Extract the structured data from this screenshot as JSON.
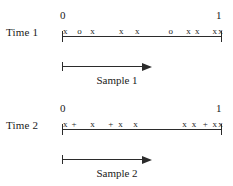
{
  "figure": {
    "description": "Two number lines from 0 to 1 showing sampled observations at two times",
    "ink_color": "#2b2b2b",
    "background_color": "#ffffff"
  },
  "rows": [
    {
      "id": "time1",
      "label": "Time 1",
      "axis": {
        "start_label": "0",
        "end_label": "1",
        "min": 0,
        "max": 1
      },
      "marks": [
        {
          "symbol": "x",
          "position": 0.02
        },
        {
          "symbol": "o",
          "position": 0.11
        },
        {
          "symbol": "x",
          "position": 0.19
        },
        {
          "symbol": "x",
          "position": 0.37
        },
        {
          "symbol": "x",
          "position": 0.47
        },
        {
          "symbol": "o",
          "position": 0.68
        },
        {
          "symbol": "x",
          "position": 0.79
        },
        {
          "symbol": "x",
          "position": 0.845
        },
        {
          "symbol": "x",
          "position": 0.955
        },
        {
          "symbol": "x",
          "position": 0.99
        }
      ],
      "sample": {
        "caption": "Sample 1"
      }
    },
    {
      "id": "time2",
      "label": "Time 2",
      "axis": {
        "start_label": "0",
        "end_label": "1",
        "min": 0,
        "max": 1
      },
      "marks": [
        {
          "symbol": "x",
          "position": 0.02
        },
        {
          "symbol": "+",
          "position": 0.075
        },
        {
          "symbol": "x",
          "position": 0.19
        },
        {
          "symbol": "+",
          "position": 0.305
        },
        {
          "symbol": "x",
          "position": 0.365
        },
        {
          "symbol": "x",
          "position": 0.46
        },
        {
          "symbol": "x",
          "position": 0.765
        },
        {
          "symbol": "x",
          "position": 0.825
        },
        {
          "symbol": "+",
          "position": 0.895
        },
        {
          "symbol": "x",
          "position": 0.955
        },
        {
          "symbol": "x",
          "position": 0.99
        }
      ],
      "sample": {
        "caption": "Sample 2"
      }
    }
  ]
}
